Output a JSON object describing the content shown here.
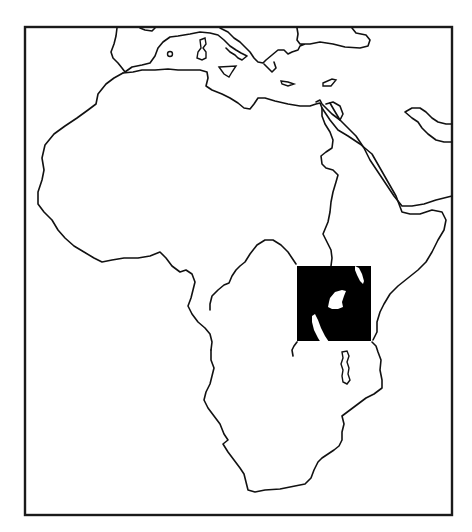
{
  "map": {
    "subject": "Africa outline map",
    "colors": {
      "background": "#ffffff",
      "line": "#111111",
      "highlight_region": "#000000",
      "highlight_lakes": "#ffffff"
    },
    "frame": {
      "x": 24,
      "y": 26,
      "width": 428,
      "height": 489
    },
    "highlight": {
      "name": "East Africa region",
      "x": 297,
      "y": 266,
      "width": 74,
      "height": 75,
      "features": [
        "lake-victoria",
        "lake-turkana",
        "lake-tanganyika"
      ]
    },
    "features": [
      "africa-coastline",
      "mediterranean-sea",
      "red-sea",
      "arabian-peninsula",
      "europe-coast",
      "lake-malawi"
    ]
  }
}
